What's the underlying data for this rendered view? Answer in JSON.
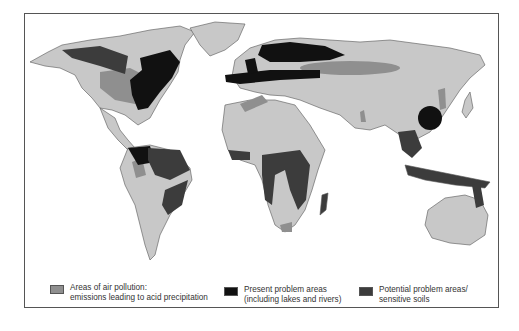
{
  "map": {
    "title": "",
    "colors": {
      "land": "#c8c8c8",
      "air_pollution": "#8f8f8f",
      "present_problem": "#111111",
      "potential_problem": "#3c3c3c",
      "border": "#555555",
      "ocean": "#ffffff"
    }
  },
  "legend": {
    "items": [
      {
        "key": "air_pollution",
        "line1": "Areas of air pollution:",
        "line2": "emissions leading to acid precipitation"
      },
      {
        "key": "present_problem",
        "line1": "Present problem areas",
        "line2": "(including lakes and rivers)"
      },
      {
        "key": "potential_problem",
        "line1": "Potential problem areas/",
        "line2": "sensitive soils"
      }
    ]
  }
}
